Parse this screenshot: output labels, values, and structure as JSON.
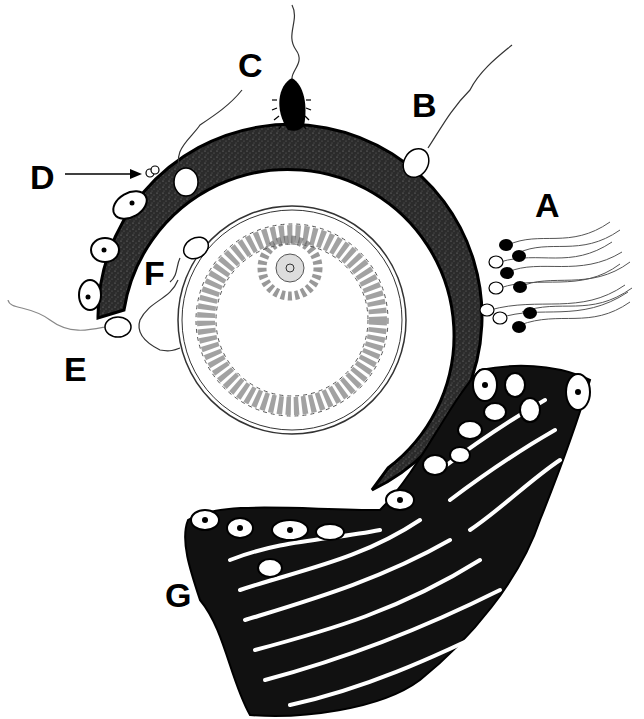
{
  "figure": {
    "colors": {
      "ink": "#000000",
      "paper": "#ffffff",
      "zona": "#2a2a2a",
      "cell_outline": "#333333"
    }
  },
  "labels": [
    {
      "id": "A",
      "text": "A",
      "x": 535,
      "y": 188
    },
    {
      "id": "B",
      "text": "B",
      "x": 412,
      "y": 88
    },
    {
      "id": "C",
      "text": "C",
      "x": 238,
      "y": 48
    },
    {
      "id": "D",
      "text": "D",
      "x": 30,
      "y": 160
    },
    {
      "id": "E",
      "text": "E",
      "x": 64,
      "y": 352
    },
    {
      "id": "F",
      "text": "F",
      "x": 144,
      "y": 256
    },
    {
      "id": "G",
      "text": "G",
      "x": 165,
      "y": 578
    }
  ],
  "structures": {
    "zona_ring": "zona-pellucida",
    "oocyte": "follicle-with-cumulus",
    "tissue": "corona-radiata-tissue"
  }
}
